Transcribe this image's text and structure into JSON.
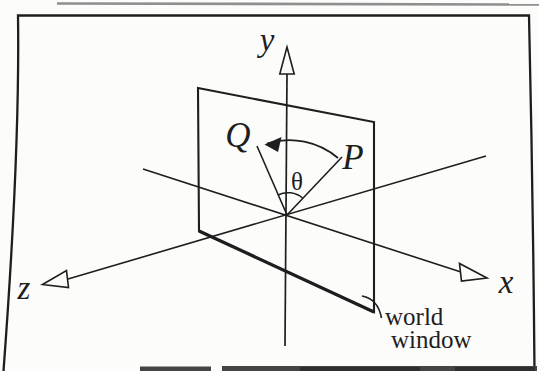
{
  "figure": {
    "labels": {
      "y_axis": "y",
      "x_axis": "x",
      "z_axis": "z",
      "point_p": "P",
      "point_q": "Q",
      "angle": "θ"
    },
    "annotation": {
      "line1": "world",
      "line2": "window"
    },
    "colors": {
      "ink": "#1e1e1e",
      "paper": "#fcfcfb",
      "artifact_gray": "#8f8f8f",
      "caption_band": "#454545"
    }
  }
}
